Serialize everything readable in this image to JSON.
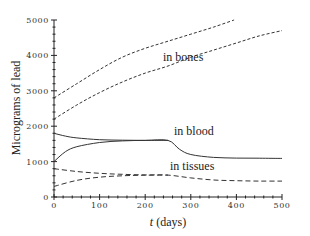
{
  "chart_data": {
    "type": "line",
    "title": "",
    "xlabel": "t (days)",
    "xlabel_italic_part": "t",
    "xlabel_rest": " (days)",
    "ylabel": "Micrograms of lead",
    "xlim": [
      0,
      500
    ],
    "ylim": [
      0,
      5000
    ],
    "grid": false,
    "legend": "none (curves labeled inline)",
    "x_ticks": [
      0,
      100,
      200,
      300,
      400,
      500
    ],
    "y_ticks": [
      0,
      1000,
      2000,
      3000,
      4000,
      5000
    ],
    "x_tick_labels": [
      "0",
      "100",
      "200",
      "300",
      "400",
      "500"
    ],
    "y_tick_labels": [
      "0",
      "1000",
      "2000",
      "3000",
      "4000",
      "5000"
    ],
    "series": [
      {
        "name": "in bones (upper)",
        "style": "dashed",
        "x": [
          0,
          50,
          100,
          150,
          200,
          250,
          300,
          350,
          395
        ],
        "values": [
          2800,
          3200,
          3600,
          3950,
          4200,
          4400,
          4600,
          4800,
          5000
        ]
      },
      {
        "name": "in bones (lower)",
        "style": "dashed",
        "x": [
          0,
          50,
          100,
          150,
          200,
          250,
          300,
          350,
          400,
          450,
          500
        ],
        "values": [
          2200,
          2600,
          2950,
          3250,
          3500,
          3700,
          3950,
          4150,
          4350,
          4550,
          4700
        ]
      },
      {
        "name": "in blood (upper)",
        "style": "solid",
        "x": [
          0,
          25,
          50,
          100,
          150,
          200,
          250,
          275,
          300,
          350,
          400,
          450,
          500
        ],
        "values": [
          1800,
          1720,
          1670,
          1620,
          1605,
          1600,
          1600,
          1350,
          1200,
          1120,
          1100,
          1095,
          1090
        ]
      },
      {
        "name": "in blood (lower)",
        "style": "solid",
        "x": [
          0,
          25,
          50,
          100,
          150,
          200,
          250
        ],
        "values": [
          1000,
          1280,
          1420,
          1540,
          1585,
          1598,
          1600
        ]
      },
      {
        "name": "in tissues (upper)",
        "style": "dashed",
        "x": [
          0,
          50,
          100,
          150,
          200,
          250,
          300,
          350,
          400,
          450,
          500
        ],
        "values": [
          800,
          720,
          670,
          640,
          625,
          620,
          540,
          480,
          460,
          450,
          450
        ]
      },
      {
        "name": "in tissues (lower)",
        "style": "dashed",
        "x": [
          0,
          50,
          100,
          150,
          200,
          250
        ],
        "values": [
          300,
          470,
          560,
          600,
          615,
          620
        ]
      }
    ],
    "annotations": [
      {
        "text": "in bones",
        "x": 240,
        "y": 3700
      },
      {
        "text": "in blood",
        "x": 260,
        "y": 1800
      },
      {
        "text": "in tissues",
        "x": 250,
        "y": 800
      }
    ]
  },
  "labels": {
    "bones": "in bones",
    "blood": "in blood",
    "tissues": "in tissues",
    "x_axis_italic": "t",
    "x_axis_rest": " (days)",
    "y_axis": "Micrograms of lead",
    "x_ticks": [
      "0",
      "100",
      "200",
      "300",
      "400",
      "500"
    ],
    "y_ticks": [
      "0",
      "1000",
      "2000",
      "3000",
      "4000",
      "5000"
    ]
  }
}
